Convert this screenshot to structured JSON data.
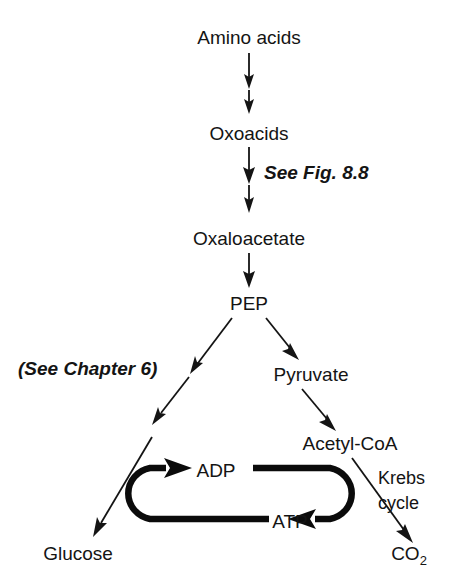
{
  "figure": {
    "background_color": "#ffffff",
    "ink_color": "#141414"
  },
  "nodes": {
    "amino_acids": "Amino acids",
    "oxoacids": "Oxoacids",
    "oxaloacetate": "Oxaloacetate",
    "pep": "PEP",
    "pyruvate": "Pyruvate",
    "acetyl_coa": "Acetyl-CoA",
    "adp": "ADP",
    "atp": "ATP",
    "glucose": "Glucose",
    "co2_main": "CO",
    "co2_sub": "2"
  },
  "annotations": {
    "see_fig": "See Fig. 8.8",
    "see_chapter": "(See Chapter 6)",
    "krebs_line1": "Krebs",
    "krebs_line2": "cycle"
  },
  "edges": [
    {
      "name": "amino-acids-to-oxoacids-1",
      "from": "Amino acids",
      "to": "Oxoacids",
      "style": "thin-arrow",
      "direction": "down"
    },
    {
      "name": "amino-acids-to-oxoacids-2",
      "from": "Amino acids",
      "to": "Oxoacids",
      "style": "thin-arrow",
      "direction": "down"
    },
    {
      "name": "oxoacids-to-oxaloacetate-1",
      "from": "Oxoacids",
      "to": "Oxaloacetate",
      "style": "thin-arrow",
      "direction": "down",
      "label": "See Fig. 8.8"
    },
    {
      "name": "oxoacids-to-oxaloacetate-2",
      "from": "Oxoacids",
      "to": "Oxaloacetate",
      "style": "thin-arrow",
      "direction": "down"
    },
    {
      "name": "oxaloacetate-to-pep",
      "from": "Oxaloacetate",
      "to": "PEP",
      "style": "thin-arrow",
      "direction": "down"
    },
    {
      "name": "pep-to-glucose-1",
      "from": "PEP",
      "to": "Glucose",
      "style": "thin-arrow",
      "direction": "down-left",
      "label": "(See Chapter 6)"
    },
    {
      "name": "pep-to-glucose-2",
      "from": "PEP",
      "to": "Glucose",
      "style": "thin-arrow",
      "direction": "down-left"
    },
    {
      "name": "pep-to-pyruvate",
      "from": "PEP",
      "to": "Pyruvate",
      "style": "thin-arrow",
      "direction": "down-right"
    },
    {
      "name": "pyruvate-to-acetyl-coa",
      "from": "Pyruvate",
      "to": "Acetyl-CoA",
      "style": "thin-arrow",
      "direction": "down-right"
    },
    {
      "name": "acetyl-coa-to-co2",
      "from": "Acetyl-CoA",
      "to": "CO2",
      "style": "thin-arrow",
      "direction": "down-right",
      "label": "Krebs cycle"
    },
    {
      "name": "atp-to-adp-loop",
      "from": "ATP",
      "to": "ADP",
      "style": "thick-arrow",
      "direction": "u-turn-left"
    },
    {
      "name": "adp-to-atp-loop",
      "from": "ADP",
      "to": "ATP",
      "style": "thick-arrow",
      "direction": "u-turn-right"
    }
  ]
}
